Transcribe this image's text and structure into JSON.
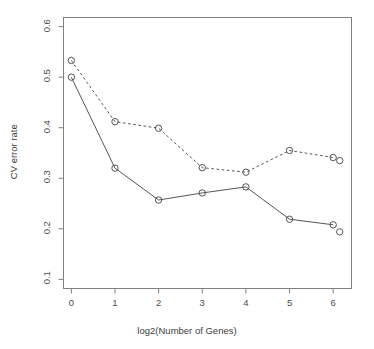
{
  "chart_data": {
    "type": "line",
    "title": "",
    "subtitle": "",
    "xlabel": "log2(Number of Genes)",
    "ylabel": "CV error rate",
    "xlim": [
      -0.18,
      6.42
    ],
    "ylim": [
      0.082,
      0.618
    ],
    "xticks": [
      0,
      1,
      2,
      3,
      4,
      5,
      6
    ],
    "xtick_labels": [
      "0",
      "1",
      "2",
      "3",
      "4",
      "5",
      "6"
    ],
    "yticks": [
      0.1,
      0.2,
      0.3,
      0.4,
      0.5,
      0.6
    ],
    "ytick_labels": [
      "0.1",
      "0.2",
      "0.3",
      "0.4",
      "0.5",
      "0.6"
    ],
    "grid": false,
    "legend": false,
    "legend_position": "none",
    "marker": "open-circle",
    "marker_radius": 3.2,
    "series": [
      {
        "name": "dashed-series",
        "linestyle": "dashed",
        "color": "#555555",
        "x": [
          0,
          1,
          2,
          3,
          4,
          5,
          6,
          6.15
        ],
        "values": [
          0.533,
          0.412,
          0.399,
          0.321,
          0.312,
          0.355,
          0.341,
          0.335
        ]
      },
      {
        "name": "solid-series",
        "linestyle": "solid",
        "color": "#555555",
        "x": [
          0,
          1,
          2,
          3,
          4,
          5,
          6,
          6.15
        ],
        "values": [
          0.5,
          0.32,
          0.257,
          0.271,
          0.283,
          0.219,
          0.208,
          0.194
        ]
      }
    ]
  },
  "axes": {
    "box_color": "#808080",
    "tick_color": "#808080",
    "label_color": "#4d4d4d"
  }
}
